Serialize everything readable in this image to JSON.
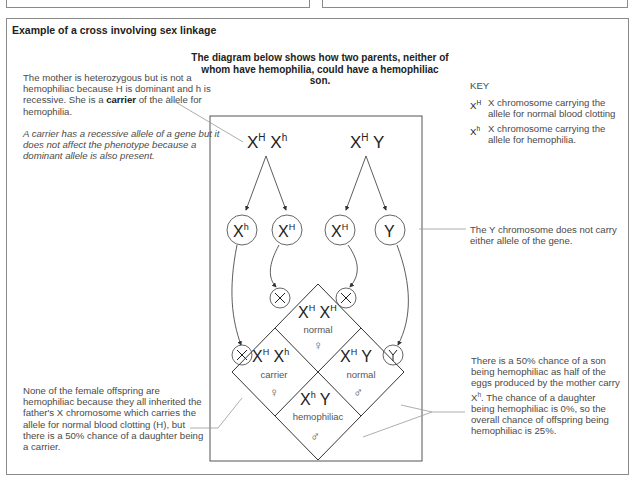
{
  "header": {
    "title": "Example of a cross involving sex linkage",
    "intro": "The diagram below shows how two parents, neither of whom have hemophilia, could have a hemophiliac son."
  },
  "annotations": {
    "mother_note_1": "The mother is heterozygous but is not a hemophiliac because H is dominant and h is recessive. She is a",
    "mother_note_bold": "carrier",
    "mother_note_2": "of the allele for hemophilia.",
    "carrier_definition": "A carrier has a recessive allele of a gene but it does not affect the phenotype because a dominant allele is also present.",
    "y_note": "The  Y chromosome does not carry either allele of the gene.",
    "female_note": "None of the female offspring are hemophiliac because they all inherited the father's X chromosome which carries the allele for normal blood clotting (H), but there is a 50% chance of a daughter being a carrier.",
    "son_note_1": "There is a 50% chance of a son being hemophiliac as half of the eggs produced by the mother carry X",
    "son_note_sup": "h",
    "son_note_2": ". The chance of a daughter being hemophiliac is 0%, so the overall chance of offspring being hemophiliac is 25%."
  },
  "key": {
    "title": "KEY",
    "items": [
      {
        "symbol": "X",
        "sup": "H",
        "text": "X chromosome carrying the allele for normal blood clotting"
      },
      {
        "symbol": "X",
        "sup": "h",
        "text": "X chromosome carrying the allele for hemophilia."
      }
    ]
  },
  "diagram": {
    "mother": {
      "a1": "X",
      "a1sup": "H",
      "a2": "X",
      "a2sup": "h"
    },
    "father": {
      "a1": "X",
      "a1sup": "H",
      "a2": "Y"
    },
    "gametes": [
      {
        "label": "X",
        "sup": "h"
      },
      {
        "label": "X",
        "sup": "H"
      },
      {
        "label": "X",
        "sup": "H"
      },
      {
        "label": "Y",
        "sup": ""
      }
    ],
    "offspring": [
      {
        "genotype": "X",
        "sup1": "H",
        "g2": "X",
        "sup2": "H",
        "phenotype": "normal",
        "sex": "♀"
      },
      {
        "genotype": "X",
        "sup1": "H",
        "g2": "X",
        "sup2": "h",
        "phenotype": "carrier",
        "sex": "♀"
      },
      {
        "genotype": "X",
        "sup1": "H",
        "g2": "Y",
        "sup2": "",
        "phenotype": "normal",
        "sex": "♂"
      },
      {
        "genotype": "X",
        "sup1": "h",
        "g2": "Y",
        "sup2": "",
        "phenotype": "hemophiliac",
        "sex": "♂"
      }
    ]
  }
}
